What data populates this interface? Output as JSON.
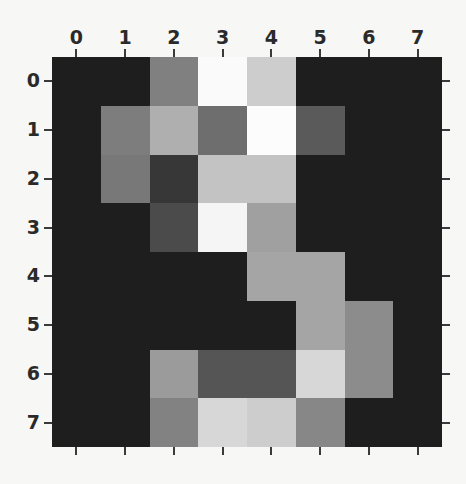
{
  "chart_data": {
    "type": "heatmap",
    "title": "",
    "xlabel": "",
    "ylabel": "",
    "grid": false,
    "legend": "none",
    "colormap": "gray",
    "colormap_min_hex": "#1e1e1e",
    "colormap_max_hex": "#fcfcfc",
    "vmin": 0,
    "vmax": 255,
    "rows": 8,
    "cols": 8,
    "xticks": [
      "0",
      "1",
      "2",
      "3",
      "4",
      "5",
      "6",
      "7"
    ],
    "yticks": [
      "0",
      "1",
      "2",
      "3",
      "4",
      "5",
      "6",
      "7"
    ],
    "xtick_position": "top",
    "ytick_position": "left",
    "x": [
      0,
      1,
      2,
      3,
      4,
      5,
      6,
      7
    ],
    "y": [
      0,
      1,
      2,
      3,
      4,
      5,
      6,
      7
    ],
    "values": [
      [
        30,
        30,
        128,
        250,
        205,
        30,
        30,
        30
      ],
      [
        30,
        125,
        175,
        110,
        252,
        90,
        30,
        30
      ],
      [
        30,
        120,
        55,
        195,
        195,
        30,
        30,
        30
      ],
      [
        30,
        30,
        75,
        245,
        160,
        30,
        30,
        30
      ],
      [
        30,
        30,
        30,
        30,
        165,
        165,
        30,
        30
      ],
      [
        30,
        30,
        30,
        30,
        30,
        165,
        140,
        30
      ],
      [
        30,
        30,
        155,
        85,
        85,
        215,
        140,
        30
      ],
      [
        30,
        30,
        130,
        215,
        205,
        135,
        30,
        30
      ]
    ]
  }
}
